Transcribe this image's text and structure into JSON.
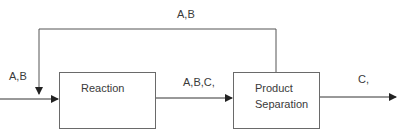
{
  "diagram": {
    "type": "process-flow",
    "blocks": [
      {
        "id": "reaction",
        "lines": [
          "Reaction"
        ]
      },
      {
        "id": "product_separation",
        "lines": [
          "Product",
          "Separation"
        ]
      }
    ],
    "streams": {
      "feed": {
        "label": "A,B"
      },
      "reactor_outlet": {
        "label": "A,B,C,"
      },
      "product": {
        "label": "C,"
      },
      "recycle": {
        "label": "A,B"
      }
    },
    "colors": {
      "line": "#555555",
      "box_border": "#6a6a6a",
      "text": "#3a3a3a"
    }
  }
}
